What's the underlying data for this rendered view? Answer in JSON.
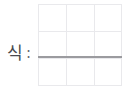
{
  "worksheet": {
    "prompt_label": "식",
    "prompt_separator": ":",
    "answer_value": "",
    "grid": {
      "columns": 3,
      "rows": 3,
      "line_color": "#e9e9ec",
      "border_color": "#e9e9ec"
    },
    "answer_line": {
      "color": "#9b9b9f",
      "thickness_px": 2
    },
    "background_color": "#ffffff",
    "text_color": "#4a4a4f"
  }
}
